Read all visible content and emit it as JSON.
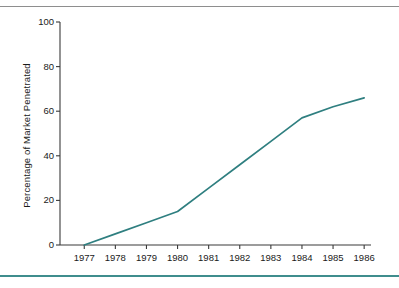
{
  "figure": {
    "background_color": "#ffffff",
    "top_rule_color": "#8e8e8e",
    "bottom_rule_color": "#3f8d8d"
  },
  "chart_data": {
    "type": "line",
    "title": "",
    "subtitle": "",
    "xlabel": "",
    "ylabel": "Percentage of Market Penetrated",
    "categories": [
      "1977",
      "1978",
      "1979",
      "1980",
      "1981",
      "1982",
      "1983",
      "1984",
      "1985",
      "1986"
    ],
    "x": [
      1977,
      1978,
      1979,
      1980,
      1981,
      1982,
      1983,
      1984,
      1985,
      1986
    ],
    "values": [
      0,
      5,
      10,
      15,
      25.5,
      36,
      46.5,
      57,
      62,
      66
    ],
    "series": [
      {
        "name": "Percentage of Market Penetrated",
        "color": "#2f7f80",
        "values": [
          0,
          5,
          10,
          15,
          25.5,
          36,
          46.5,
          57,
          62,
          66
        ]
      }
    ],
    "ylim": [
      0,
      100
    ],
    "yticks": [
      0,
      20,
      40,
      60,
      80,
      100
    ],
    "ytick_labels": [
      "0",
      "20",
      "40",
      "60",
      "80",
      "100"
    ],
    "xtick_labels": [
      "1977",
      "1978",
      "1979",
      "1980",
      "1981",
      "1982",
      "1983",
      "1984",
      "1985",
      "1986"
    ],
    "grid": false,
    "legend": null,
    "legend_position": "none",
    "line_color": "#2f7f80",
    "axis_color": "#3a3a3a",
    "annotations": []
  }
}
